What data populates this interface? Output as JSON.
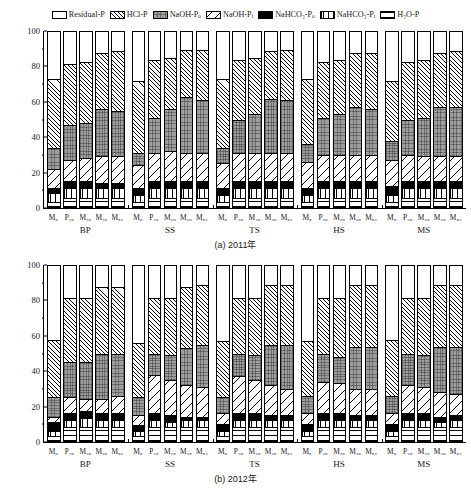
{
  "topstrip_text": "  ",
  "legend": [
    {
      "key": "residual",
      "label": "Residual-P",
      "sub": "",
      "pattern": "p-residual"
    },
    {
      "key": "hclp",
      "label": "HCl-P",
      "sub": "",
      "pattern": "p-hclp"
    },
    {
      "key": "naoh_po",
      "label": "NaOH-P",
      "sub": "o",
      "pattern": "p-naohpo"
    },
    {
      "key": "naoh_pi",
      "label": "NaOH-P",
      "sub": "i",
      "pattern": "p-naohpi"
    },
    {
      "key": "nahco3_po",
      "label": "NaHCO₃-P",
      "sub": "o",
      "pattern": "p-nahco3po"
    },
    {
      "key": "nahco3_pi",
      "label": "NaHCO₃-P",
      "sub": "i",
      "pattern": "p-nahco3pi"
    },
    {
      "key": "h2op",
      "label": "H₂O-P",
      "sub": "",
      "pattern": "p-h2op"
    }
  ],
  "axis": {
    "ylabel": "磷素各组分占总磷的比例/%",
    "yticks": [
      "0",
      "20",
      "40",
      "60",
      "80",
      "100"
    ],
    "ylim": [
      0,
      100
    ]
  },
  "panels": [
    {
      "id": "a",
      "caption": "(a) 2011年"
    },
    {
      "id": "b",
      "caption": "(b) 2012年"
    }
  ],
  "groups": [
    "BP",
    "SS",
    "TS",
    "HS",
    "MS"
  ],
  "bar_labels": [
    "M₀",
    "P₂₀",
    "M₂₀",
    "M₃₀",
    "M₅₂"
  ],
  "chart_data": {
    "type": "bar",
    "subtype": "stacked-bar, 100% composition, two panels",
    "title": "",
    "xlabel": "",
    "ylabel": "磷素各组分占总磷的比例/%",
    "ylim": [
      0,
      100
    ],
    "yticks": [
      0,
      20,
      40,
      60,
      80,
      100
    ],
    "grid": false,
    "legend_position": "top-center",
    "stack_order_bottom_to_top": [
      "H2O-P",
      "NaHCO3-Pi",
      "NaHCO3-Po",
      "NaOH-Pi",
      "NaOH-Po",
      "HCl-P",
      "Residual-P"
    ],
    "series": [
      {
        "name": "H₂O-P",
        "key": "h2op"
      },
      {
        "name": "NaHCO₃-Pᵢ",
        "key": "nahco3_pi"
      },
      {
        "name": "NaHCO₃-Pₒ",
        "key": "nahco3_po"
      },
      {
        "name": "NaOH-Pᵢ",
        "key": "naoh_pi"
      },
      {
        "name": "NaOH-Pₒ",
        "key": "naoh_po"
      },
      {
        "name": "HCl-P",
        "key": "hclp"
      },
      {
        "name": "Residual-P",
        "key": "residual"
      }
    ],
    "categories": [
      "BP",
      "SS",
      "TS",
      "HS",
      "MS"
    ],
    "subcategories": [
      "M0",
      "P20",
      "M20",
      "M30",
      "M52"
    ],
    "panels": [
      {
        "panel": "a",
        "caption": "(a) 2011年",
        "bars": [
          {
            "group": "BP",
            "sub": "M0",
            "values": {
              "h2op": 3,
              "nahco3_pi": 5,
              "nahco3_po": 3,
              "naoh_pi": 11,
              "naoh_po": 12,
              "hclp": 39,
              "residual": 27
            }
          },
          {
            "group": "BP",
            "sub": "P20",
            "values": {
              "h2op": 5,
              "nahco3_pi": 6,
              "nahco3_po": 4,
              "naoh_pi": 12,
              "naoh_po": 20,
              "hclp": 35,
              "residual": 18
            }
          },
          {
            "group": "BP",
            "sub": "M20",
            "values": {
              "h2op": 5,
              "nahco3_pi": 6,
              "nahco3_po": 4,
              "naoh_pi": 13,
              "naoh_po": 20,
              "hclp": 35,
              "residual": 17
            }
          },
          {
            "group": "BP",
            "sub": "M30",
            "values": {
              "h2op": 5,
              "nahco3_pi": 6,
              "nahco3_po": 3,
              "naoh_pi": 15,
              "naoh_po": 27,
              "hclp": 32,
              "residual": 12
            }
          },
          {
            "group": "BP",
            "sub": "M52",
            "values": {
              "h2op": 5,
              "nahco3_pi": 6,
              "nahco3_po": 3,
              "naoh_pi": 15,
              "naoh_po": 26,
              "hclp": 34,
              "residual": 11
            }
          },
          {
            "group": "SS",
            "sub": "M0",
            "values": {
              "h2op": 3,
              "nahco3_pi": 4,
              "nahco3_po": 4,
              "naoh_pi": 13,
              "naoh_po": 7,
              "hclp": 41,
              "residual": 28
            }
          },
          {
            "group": "SS",
            "sub": "P20",
            "values": {
              "h2op": 5,
              "nahco3_pi": 6,
              "nahco3_po": 4,
              "naoh_pi": 16,
              "naoh_po": 20,
              "hclp": 33,
              "residual": 16
            }
          },
          {
            "group": "SS",
            "sub": "M20",
            "values": {
              "h2op": 5,
              "nahco3_pi": 6,
              "nahco3_po": 4,
              "naoh_pi": 17,
              "naoh_po": 24,
              "hclp": 29,
              "residual": 15
            }
          },
          {
            "group": "SS",
            "sub": "M30",
            "values": {
              "h2op": 5,
              "nahco3_pi": 6,
              "nahco3_po": 4,
              "naoh_pi": 16,
              "naoh_po": 32,
              "hclp": 27,
              "residual": 10
            }
          },
          {
            "group": "SS",
            "sub": "M52",
            "values": {
              "h2op": 5,
              "nahco3_pi": 6,
              "nahco3_po": 4,
              "naoh_pi": 16,
              "naoh_po": 30,
              "hclp": 29,
              "residual": 10
            }
          },
          {
            "group": "TS",
            "sub": "M0",
            "values": {
              "h2op": 3,
              "nahco3_pi": 4,
              "nahco3_po": 4,
              "naoh_pi": 14,
              "naoh_po": 9,
              "hclp": 39,
              "residual": 27
            }
          },
          {
            "group": "TS",
            "sub": "P20",
            "values": {
              "h2op": 5,
              "nahco3_pi": 6,
              "nahco3_po": 4,
              "naoh_pi": 16,
              "naoh_po": 19,
              "hclp": 34,
              "residual": 16
            }
          },
          {
            "group": "TS",
            "sub": "M20",
            "values": {
              "h2op": 5,
              "nahco3_pi": 6,
              "nahco3_po": 4,
              "naoh_pi": 16,
              "naoh_po": 22,
              "hclp": 32,
              "residual": 15
            }
          },
          {
            "group": "TS",
            "sub": "M30",
            "values": {
              "h2op": 5,
              "nahco3_pi": 6,
              "nahco3_po": 4,
              "naoh_pi": 16,
              "naoh_po": 31,
              "hclp": 27,
              "residual": 11
            }
          },
          {
            "group": "TS",
            "sub": "M52",
            "values": {
              "h2op": 5,
              "nahco3_pi": 6,
              "nahco3_po": 4,
              "naoh_pi": 16,
              "naoh_po": 30,
              "hclp": 29,
              "residual": 10
            }
          },
          {
            "group": "HS",
            "sub": "M0",
            "values": {
              "h2op": 3,
              "nahco3_pi": 4,
              "nahco3_po": 4,
              "naoh_pi": 15,
              "naoh_po": 10,
              "hclp": 37,
              "residual": 27
            }
          },
          {
            "group": "HS",
            "sub": "P20",
            "values": {
              "h2op": 5,
              "nahco3_pi": 6,
              "nahco3_po": 4,
              "naoh_pi": 15,
              "naoh_po": 21,
              "hclp": 32,
              "residual": 17
            }
          },
          {
            "group": "HS",
            "sub": "M20",
            "values": {
              "h2op": 5,
              "nahco3_pi": 6,
              "nahco3_po": 4,
              "naoh_pi": 15,
              "naoh_po": 23,
              "hclp": 31,
              "residual": 16
            }
          },
          {
            "group": "HS",
            "sub": "M30",
            "values": {
              "h2op": 5,
              "nahco3_pi": 6,
              "nahco3_po": 4,
              "naoh_pi": 15,
              "naoh_po": 27,
              "hclp": 31,
              "residual": 12
            }
          },
          {
            "group": "HS",
            "sub": "M52",
            "values": {
              "h2op": 5,
              "nahco3_pi": 6,
              "nahco3_po": 4,
              "naoh_pi": 15,
              "naoh_po": 26,
              "hclp": 32,
              "residual": 12
            }
          },
          {
            "group": "MS",
            "sub": "M0",
            "values": {
              "h2op": 3,
              "nahco3_pi": 4,
              "nahco3_po": 5,
              "naoh_pi": 15,
              "naoh_po": 11,
              "hclp": 34,
              "residual": 28
            }
          },
          {
            "group": "MS",
            "sub": "P20",
            "values": {
              "h2op": 5,
              "nahco3_pi": 6,
              "nahco3_po": 4,
              "naoh_pi": 15,
              "naoh_po": 20,
              "hclp": 33,
              "residual": 17
            }
          },
          {
            "group": "MS",
            "sub": "M20",
            "values": {
              "h2op": 5,
              "nahco3_pi": 6,
              "nahco3_po": 4,
              "naoh_pi": 14,
              "naoh_po": 22,
              "hclp": 33,
              "residual": 16
            }
          },
          {
            "group": "MS",
            "sub": "M30",
            "values": {
              "h2op": 5,
              "nahco3_pi": 6,
              "nahco3_po": 4,
              "naoh_pi": 14,
              "naoh_po": 28,
              "hclp": 31,
              "residual": 12
            }
          },
          {
            "group": "MS",
            "sub": "M52",
            "values": {
              "h2op": 5,
              "nahco3_pi": 6,
              "nahco3_po": 4,
              "naoh_pi": 14,
              "naoh_po": 28,
              "hclp": 32,
              "residual": 11
            }
          }
        ]
      },
      {
        "panel": "b",
        "caption": "(b) 2012年",
        "bars": [
          {
            "group": "BP",
            "sub": "M0",
            "values": {
              "h2op": 3,
              "nahco3_pi": 3,
              "nahco3_po": 5,
              "naoh_pi": 3,
              "naoh_po": 11,
              "hclp": 33,
              "residual": 42
            }
          },
          {
            "group": "BP",
            "sub": "P20",
            "values": {
              "h2op": 8,
              "nahco3_pi": 4,
              "nahco3_po": 4,
              "naoh_pi": 9,
              "naoh_po": 20,
              "hclp": 37,
              "residual": 18
            }
          },
          {
            "group": "BP",
            "sub": "M20",
            "values": {
              "h2op": 8,
              "nahco3_pi": 5,
              "nahco3_po": 4,
              "naoh_pi": 7,
              "naoh_po": 21,
              "hclp": 37,
              "residual": 18
            }
          },
          {
            "group": "BP",
            "sub": "M30",
            "values": {
              "h2op": 8,
              "nahco3_pi": 4,
              "nahco3_po": 4,
              "naoh_pi": 8,
              "naoh_po": 26,
              "hclp": 38,
              "residual": 12
            }
          },
          {
            "group": "BP",
            "sub": "M52",
            "values": {
              "h2op": 8,
              "nahco3_pi": 4,
              "nahco3_po": 4,
              "naoh_pi": 10,
              "naoh_po": 24,
              "hclp": 38,
              "residual": 12
            }
          },
          {
            "group": "SS",
            "sub": "M0",
            "values": {
              "h2op": 3,
              "nahco3_pi": 3,
              "nahco3_po": 3,
              "naoh_pi": 6,
              "naoh_po": 10,
              "hclp": 31,
              "residual": 44
            }
          },
          {
            "group": "SS",
            "sub": "P20",
            "values": {
              "h2op": 8,
              "nahco3_pi": 4,
              "nahco3_po": 4,
              "naoh_pi": 22,
              "naoh_po": 12,
              "hclp": 32,
              "residual": 18
            }
          },
          {
            "group": "SS",
            "sub": "M20",
            "values": {
              "h2op": 8,
              "nahco3_pi": 3,
              "nahco3_po": 4,
              "naoh_pi": 20,
              "naoh_po": 14,
              "hclp": 33,
              "residual": 18
            }
          },
          {
            "group": "SS",
            "sub": "M30",
            "values": {
              "h2op": 8,
              "nahco3_pi": 4,
              "nahco3_po": 2,
              "naoh_pi": 18,
              "naoh_po": 21,
              "hclp": 35,
              "residual": 12
            }
          },
          {
            "group": "SS",
            "sub": "M52",
            "values": {
              "h2op": 8,
              "nahco3_pi": 4,
              "nahco3_po": 2,
              "naoh_pi": 17,
              "naoh_po": 24,
              "hclp": 34,
              "residual": 11
            }
          },
          {
            "group": "TS",
            "sub": "M0",
            "values": {
              "h2op": 3,
              "nahco3_pi": 3,
              "nahco3_po": 4,
              "naoh_pi": 6,
              "naoh_po": 9,
              "hclp": 32,
              "residual": 43
            }
          },
          {
            "group": "TS",
            "sub": "P20",
            "values": {
              "h2op": 8,
              "nahco3_pi": 4,
              "nahco3_po": 4,
              "naoh_pi": 21,
              "naoh_po": 13,
              "hclp": 32,
              "residual": 18
            }
          },
          {
            "group": "TS",
            "sub": "M20",
            "values": {
              "h2op": 8,
              "nahco3_pi": 4,
              "nahco3_po": 4,
              "naoh_pi": 19,
              "naoh_po": 14,
              "hclp": 33,
              "residual": 18
            }
          },
          {
            "group": "TS",
            "sub": "M30",
            "values": {
              "h2op": 8,
              "nahco3_pi": 4,
              "nahco3_po": 3,
              "naoh_pi": 17,
              "naoh_po": 23,
              "hclp": 34,
              "residual": 11
            }
          },
          {
            "group": "TS",
            "sub": "M52",
            "values": {
              "h2op": 8,
              "nahco3_pi": 4,
              "nahco3_po": 3,
              "naoh_pi": 15,
              "naoh_po": 25,
              "hclp": 34,
              "residual": 11
            }
          },
          {
            "group": "HS",
            "sub": "M0",
            "values": {
              "h2op": 3,
              "nahco3_pi": 3,
              "nahco3_po": 4,
              "naoh_pi": 6,
              "naoh_po": 10,
              "hclp": 31,
              "residual": 43
            }
          },
          {
            "group": "HS",
            "sub": "P20",
            "values": {
              "h2op": 8,
              "nahco3_pi": 4,
              "nahco3_po": 4,
              "naoh_pi": 18,
              "naoh_po": 16,
              "hclp": 32,
              "residual": 18
            }
          },
          {
            "group": "HS",
            "sub": "M20",
            "values": {
              "h2op": 8,
              "nahco3_pi": 4,
              "nahco3_po": 4,
              "naoh_pi": 17,
              "naoh_po": 15,
              "hclp": 34,
              "residual": 18
            }
          },
          {
            "group": "HS",
            "sub": "M30",
            "values": {
              "h2op": 8,
              "nahco3_pi": 4,
              "nahco3_po": 3,
              "naoh_pi": 15,
              "naoh_po": 24,
              "hclp": 35,
              "residual": 11
            }
          },
          {
            "group": "HS",
            "sub": "M52",
            "values": {
              "h2op": 8,
              "nahco3_pi": 4,
              "nahco3_po": 3,
              "naoh_pi": 15,
              "naoh_po": 24,
              "hclp": 35,
              "residual": 11
            }
          },
          {
            "group": "MS",
            "sub": "M0",
            "values": {
              "h2op": 3,
              "nahco3_pi": 3,
              "nahco3_po": 4,
              "naoh_pi": 6,
              "naoh_po": 10,
              "hclp": 32,
              "residual": 42
            }
          },
          {
            "group": "MS",
            "sub": "P20",
            "values": {
              "h2op": 8,
              "nahco3_pi": 4,
              "nahco3_po": 4,
              "naoh_pi": 16,
              "naoh_po": 18,
              "hclp": 32,
              "residual": 18
            }
          },
          {
            "group": "MS",
            "sub": "M20",
            "values": {
              "h2op": 8,
              "nahco3_pi": 4,
              "nahco3_po": 4,
              "naoh_pi": 15,
              "naoh_po": 18,
              "hclp": 33,
              "residual": 18
            }
          },
          {
            "group": "MS",
            "sub": "M30",
            "values": {
              "h2op": 8,
              "nahco3_pi": 3,
              "nahco3_po": 3,
              "naoh_pi": 14,
              "naoh_po": 26,
              "hclp": 35,
              "residual": 11
            }
          },
          {
            "group": "MS",
            "sub": "M52",
            "values": {
              "h2op": 8,
              "nahco3_pi": 4,
              "nahco3_po": 3,
              "naoh_pi": 12,
              "naoh_po": 27,
              "hclp": 35,
              "residual": 11
            }
          }
        ]
      }
    ]
  }
}
